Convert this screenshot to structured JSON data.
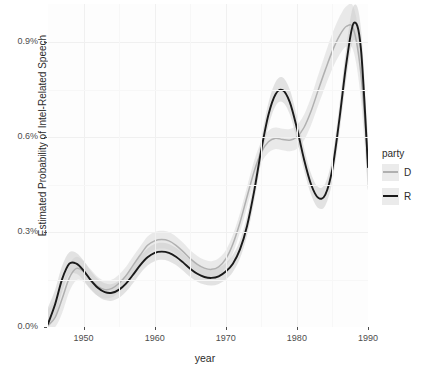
{
  "chart_data": {
    "type": "line",
    "title": "",
    "xlabel": "year",
    "ylabel": "Estimated Probability of Intel-Related Speech",
    "xlim": [
      1945,
      1990
    ],
    "ylim": [
      0.0,
      1.02
    ],
    "y_unit": "%",
    "grid": true,
    "legend": {
      "title": "party",
      "position": "right",
      "entries": [
        {
          "label": "D",
          "color": "#b0b0b0"
        },
        {
          "label": "R",
          "color": "#1a1a1a"
        }
      ]
    },
    "x_ticks": [
      1950,
      1960,
      1970,
      1980,
      1990
    ],
    "x_tick_labels": [
      "1950",
      "1960",
      "1970",
      "1980",
      "1990"
    ],
    "y_ticks": [
      0.0,
      0.3,
      0.6,
      0.9
    ],
    "y_tick_labels": [
      "0.0%",
      "0.3%",
      "0.6%",
      "0.9%"
    ],
    "series": [
      {
        "name": "D",
        "color": "#b0b0b0",
        "band_color": "#d9d9d9",
        "x": [
          1945,
          1946,
          1947,
          1948,
          1949,
          1950,
          1951,
          1952,
          1953,
          1954,
          1955,
          1956,
          1957,
          1958,
          1959,
          1960,
          1961,
          1962,
          1963,
          1964,
          1965,
          1966,
          1967,
          1968,
          1969,
          1970,
          1971,
          1972,
          1973,
          1974,
          1975,
          1976,
          1977,
          1978,
          1979,
          1980,
          1981,
          1982,
          1983,
          1984,
          1985,
          1986,
          1987,
          1988,
          1989,
          1990
        ],
        "values": [
          0.005,
          0.03,
          0.09,
          0.155,
          0.185,
          0.175,
          0.15,
          0.128,
          0.118,
          0.122,
          0.138,
          0.163,
          0.196,
          0.228,
          0.258,
          0.272,
          0.276,
          0.272,
          0.258,
          0.238,
          0.216,
          0.198,
          0.186,
          0.182,
          0.19,
          0.215,
          0.262,
          0.33,
          0.412,
          0.492,
          0.552,
          0.585,
          0.596,
          0.592,
          0.59,
          0.6,
          0.63,
          0.682,
          0.748,
          0.812,
          0.872,
          0.92,
          0.95,
          0.938,
          0.8,
          0.52
        ],
        "ci_low": [
          0.0,
          0.0,
          0.045,
          0.112,
          0.148,
          0.142,
          0.118,
          0.098,
          0.09,
          0.094,
          0.11,
          0.135,
          0.168,
          0.2,
          0.23,
          0.244,
          0.248,
          0.244,
          0.23,
          0.21,
          0.19,
          0.172,
          0.16,
          0.156,
          0.163,
          0.188,
          0.233,
          0.3,
          0.38,
          0.458,
          0.518,
          0.55,
          0.562,
          0.558,
          0.555,
          0.563,
          0.59,
          0.638,
          0.7,
          0.76,
          0.816,
          0.86,
          0.886,
          0.868,
          0.72,
          0.43
        ],
        "ci_high": [
          0.055,
          0.085,
          0.135,
          0.198,
          0.222,
          0.208,
          0.182,
          0.158,
          0.146,
          0.15,
          0.166,
          0.191,
          0.224,
          0.256,
          0.286,
          0.3,
          0.304,
          0.3,
          0.286,
          0.266,
          0.242,
          0.224,
          0.212,
          0.208,
          0.217,
          0.242,
          0.291,
          0.36,
          0.444,
          0.526,
          0.586,
          0.62,
          0.63,
          0.626,
          0.625,
          0.637,
          0.67,
          0.726,
          0.796,
          0.864,
          0.928,
          0.98,
          1.014,
          1.008,
          0.88,
          0.61
        ]
      },
      {
        "name": "R",
        "color": "#1a1a1a",
        "band_color": "#cccccc",
        "x": [
          1945,
          1946,
          1947,
          1948,
          1949,
          1950,
          1951,
          1952,
          1953,
          1954,
          1955,
          1956,
          1957,
          1958,
          1959,
          1960,
          1961,
          1962,
          1963,
          1964,
          1965,
          1966,
          1967,
          1968,
          1969,
          1970,
          1971,
          1972,
          1973,
          1974,
          1975,
          1976,
          1977,
          1978,
          1979,
          1980,
          1981,
          1982,
          1983,
          1984,
          1985,
          1986,
          1987,
          1988,
          1989,
          1990
        ],
        "values": [
          0.01,
          0.072,
          0.152,
          0.2,
          0.2,
          0.178,
          0.148,
          0.124,
          0.11,
          0.108,
          0.118,
          0.138,
          0.166,
          0.196,
          0.22,
          0.234,
          0.238,
          0.234,
          0.222,
          0.204,
          0.184,
          0.168,
          0.158,
          0.155,
          0.16,
          0.175,
          0.2,
          0.245,
          0.32,
          0.43,
          0.56,
          0.67,
          0.735,
          0.748,
          0.71,
          0.628,
          0.53,
          0.45,
          0.408,
          0.418,
          0.5,
          0.66,
          0.84,
          0.96,
          0.88,
          0.505
        ],
        "ci_low": [
          0.0,
          0.03,
          0.112,
          0.166,
          0.168,
          0.148,
          0.12,
          0.098,
          0.085,
          0.083,
          0.092,
          0.112,
          0.14,
          0.17,
          0.194,
          0.208,
          0.212,
          0.208,
          0.196,
          0.178,
          0.158,
          0.143,
          0.134,
          0.131,
          0.136,
          0.15,
          0.174,
          0.217,
          0.29,
          0.398,
          0.526,
          0.634,
          0.698,
          0.71,
          0.672,
          0.592,
          0.496,
          0.418,
          0.376,
          0.384,
          0.462,
          0.616,
          0.79,
          0.906,
          0.816,
          0.43
        ],
        "ci_high": [
          0.062,
          0.118,
          0.194,
          0.236,
          0.234,
          0.21,
          0.178,
          0.152,
          0.138,
          0.136,
          0.146,
          0.166,
          0.194,
          0.224,
          0.248,
          0.262,
          0.266,
          0.262,
          0.25,
          0.232,
          0.212,
          0.196,
          0.186,
          0.182,
          0.187,
          0.202,
          0.228,
          0.274,
          0.352,
          0.464,
          0.596,
          0.708,
          0.774,
          0.788,
          0.75,
          0.666,
          0.566,
          0.484,
          0.442,
          0.454,
          0.54,
          0.706,
          0.892,
          1.015,
          0.945,
          0.582
        ]
      }
    ]
  }
}
